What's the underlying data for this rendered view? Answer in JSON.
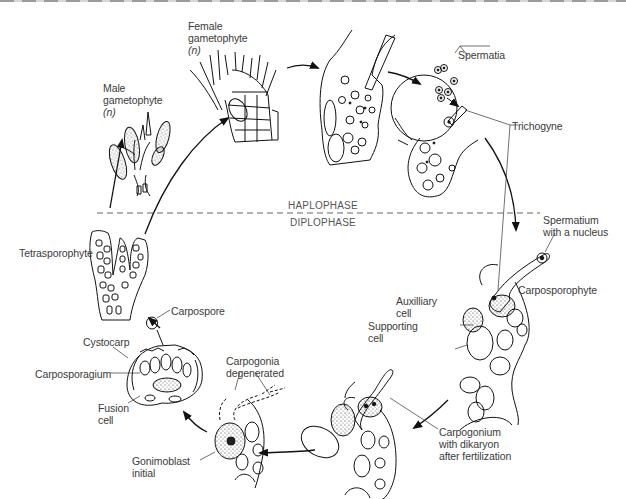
{
  "diagram": {
    "type": "life-cycle",
    "phases": {
      "upper": "HAPLOPHASE",
      "lower": "DIPLOPHASE"
    },
    "stages": [
      {
        "id": "female",
        "label_line1": "Female",
        "label_line2": "gametophyte",
        "label_line3": "(n)"
      },
      {
        "id": "male",
        "label_line1": "Male",
        "label_line2": "gametophyte",
        "label_line3": "(n)"
      },
      {
        "id": "tetrasporophyte",
        "label": "Tetrasporophyte"
      },
      {
        "id": "carpospore",
        "label": "Carpospore"
      },
      {
        "id": "cystocarp",
        "label": "Cystocarp"
      },
      {
        "id": "carposporagium",
        "label": "Carposporagium"
      },
      {
        "id": "fusion",
        "label_line1": "Fusion",
        "label_line2": "cell"
      },
      {
        "id": "carpogonia",
        "label_line1": "Carpogonia",
        "label_line2": "degenerated"
      },
      {
        "id": "gonimoblast",
        "label_line1": "Gonimoblast",
        "label_line2": "initial"
      },
      {
        "id": "carpogonium",
        "label_line1": "Carpogonium",
        "label_line2": "with dikaryon",
        "label_line3": "after fertilization"
      },
      {
        "id": "auxiliary",
        "label_line1": "Auxilliary",
        "label_line2": "cell"
      },
      {
        "id": "supporting",
        "label_line1": "Supporting",
        "label_line2": "cell"
      },
      {
        "id": "carposporophyte",
        "label": "Carposporophyte"
      },
      {
        "id": "spermatium",
        "label_line1": "Spermatium",
        "label_line2": "with a nucleus"
      },
      {
        "id": "trichogyne",
        "label": "Trichogyne"
      },
      {
        "id": "spermatia",
        "label": "Spermatia"
      }
    ],
    "cycle_order": [
      "Male gametophyte (n)",
      "Female gametophyte (n)",
      "Fertilization (Spermatia, Trichogyne)",
      "Spermatium with a nucleus / Carposporophyte",
      "Carpogonium with dikaryon after fertilization",
      "Gonimoblast initial",
      "Cystocarp",
      "Carpospore",
      "Tetrasporophyte",
      "Male gametophyte (n)"
    ]
  }
}
